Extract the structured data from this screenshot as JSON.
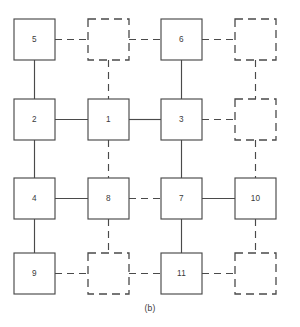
{
  "figure": {
    "caption": "(b)",
    "caption_y": 303,
    "canvas": {
      "width": 300,
      "height": 327
    },
    "colors": {
      "stroke": "#4a4a4a",
      "node_fill": "#ffffff",
      "label": "#3a3a3a",
      "background": "#ffffff"
    },
    "geometry": {
      "node_size": 41,
      "col_x": [
        14,
        88,
        161,
        235
      ],
      "row_y": [
        19,
        99,
        178,
        253
      ]
    }
  },
  "chart_data": {
    "type": "diagram",
    "title": "(b)",
    "grid": {
      "rows": 4,
      "cols": 4
    },
    "nodes": [
      {
        "id": "n-r0c0",
        "label": "5",
        "row": 0,
        "col": 0,
        "style": "solid"
      },
      {
        "id": "n-r0c1",
        "label": "",
        "row": 0,
        "col": 1,
        "style": "dashed"
      },
      {
        "id": "n-r0c2",
        "label": "6",
        "row": 0,
        "col": 2,
        "style": "solid"
      },
      {
        "id": "n-r0c3",
        "label": "",
        "row": 0,
        "col": 3,
        "style": "dashed"
      },
      {
        "id": "n-r1c0",
        "label": "2",
        "row": 1,
        "col": 0,
        "style": "solid"
      },
      {
        "id": "n-r1c1",
        "label": "1",
        "row": 1,
        "col": 1,
        "style": "solid"
      },
      {
        "id": "n-r1c2",
        "label": "3",
        "row": 1,
        "col": 2,
        "style": "solid"
      },
      {
        "id": "n-r1c3",
        "label": "",
        "row": 1,
        "col": 3,
        "style": "dashed"
      },
      {
        "id": "n-r2c0",
        "label": "4",
        "row": 2,
        "col": 0,
        "style": "solid"
      },
      {
        "id": "n-r2c1",
        "label": "8",
        "row": 2,
        "col": 1,
        "style": "solid"
      },
      {
        "id": "n-r2c2",
        "label": "7",
        "row": 2,
        "col": 2,
        "style": "solid"
      },
      {
        "id": "n-r2c3",
        "label": "10",
        "row": 2,
        "col": 3,
        "style": "solid"
      },
      {
        "id": "n-r3c0",
        "label": "9",
        "row": 3,
        "col": 0,
        "style": "solid"
      },
      {
        "id": "n-r3c1",
        "label": "",
        "row": 3,
        "col": 1,
        "style": "dashed"
      },
      {
        "id": "n-r3c2",
        "label": "11",
        "row": 3,
        "col": 2,
        "style": "solid"
      },
      {
        "id": "n-r3c3",
        "label": "",
        "row": 3,
        "col": 3,
        "style": "dashed"
      }
    ],
    "edges": [
      {
        "from": "n-r0c0",
        "to": "n-r0c1",
        "orientation": "h",
        "style": "dashed"
      },
      {
        "from": "n-r0c1",
        "to": "n-r0c2",
        "orientation": "h",
        "style": "dashed"
      },
      {
        "from": "n-r0c2",
        "to": "n-r0c3",
        "orientation": "h",
        "style": "dashed"
      },
      {
        "from": "n-r1c0",
        "to": "n-r1c1",
        "orientation": "h",
        "style": "solid"
      },
      {
        "from": "n-r1c1",
        "to": "n-r1c2",
        "orientation": "h",
        "style": "solid"
      },
      {
        "from": "n-r1c2",
        "to": "n-r1c3",
        "orientation": "h",
        "style": "dashed"
      },
      {
        "from": "n-r2c0",
        "to": "n-r2c1",
        "orientation": "h",
        "style": "solid"
      },
      {
        "from": "n-r2c1",
        "to": "n-r2c2",
        "orientation": "h",
        "style": "dashed"
      },
      {
        "from": "n-r2c2",
        "to": "n-r2c3",
        "orientation": "h",
        "style": "solid"
      },
      {
        "from": "n-r3c0",
        "to": "n-r3c1",
        "orientation": "h",
        "style": "dashed"
      },
      {
        "from": "n-r3c1",
        "to": "n-r3c2",
        "orientation": "h",
        "style": "dashed"
      },
      {
        "from": "n-r3c2",
        "to": "n-r3c3",
        "orientation": "h",
        "style": "dashed"
      },
      {
        "from": "n-r0c0",
        "to": "n-r1c0",
        "orientation": "v",
        "style": "solid"
      },
      {
        "from": "n-r0c1",
        "to": "n-r1c1",
        "orientation": "v",
        "style": "dashed"
      },
      {
        "from": "n-r0c2",
        "to": "n-r1c2",
        "orientation": "v",
        "style": "solid"
      },
      {
        "from": "n-r0c3",
        "to": "n-r1c3",
        "orientation": "v",
        "style": "dashed"
      },
      {
        "from": "n-r1c0",
        "to": "n-r2c0",
        "orientation": "v",
        "style": "solid"
      },
      {
        "from": "n-r1c1",
        "to": "n-r2c1",
        "orientation": "v",
        "style": "dashed"
      },
      {
        "from": "n-r1c2",
        "to": "n-r2c2",
        "orientation": "v",
        "style": "solid"
      },
      {
        "from": "n-r1c3",
        "to": "n-r2c3",
        "orientation": "v",
        "style": "dashed"
      },
      {
        "from": "n-r2c0",
        "to": "n-r3c0",
        "orientation": "v",
        "style": "solid"
      },
      {
        "from": "n-r2c1",
        "to": "n-r3c1",
        "orientation": "v",
        "style": "dashed"
      },
      {
        "from": "n-r2c2",
        "to": "n-r3c2",
        "orientation": "v",
        "style": "solid"
      },
      {
        "from": "n-r2c3",
        "to": "n-r3c3",
        "orientation": "v",
        "style": "dashed"
      }
    ]
  }
}
